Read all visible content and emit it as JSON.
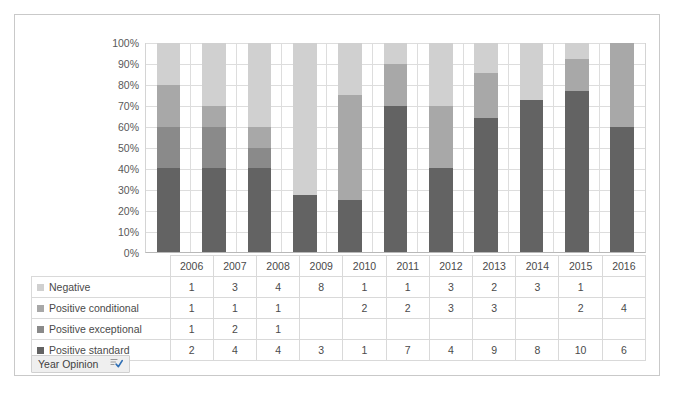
{
  "chart_data": {
    "type": "bar",
    "subtype": "stacked-100-percent-column",
    "title": "",
    "xlabel": "",
    "ylabel": "",
    "ylim": [
      0,
      100
    ],
    "ytick_labels": [
      "100%",
      "90%",
      "80%",
      "70%",
      "60%",
      "50%",
      "40%",
      "30%",
      "20%",
      "10%",
      "0%"
    ],
    "ytick_values": [
      100,
      90,
      80,
      70,
      60,
      50,
      40,
      30,
      20,
      10,
      0
    ],
    "grid": true,
    "legend_position": "table-left",
    "categories": [
      "2006",
      "2007",
      "2008",
      "2009",
      "2010",
      "2011",
      "2012",
      "2013",
      "2014",
      "2015",
      "2016"
    ],
    "series": [
      {
        "name": "Negative",
        "color": "#d0d0d0",
        "values": [
          1,
          3,
          4,
          8,
          1,
          1,
          3,
          2,
          3,
          1,
          null
        ],
        "display": [
          "1",
          "3",
          "4",
          "8",
          "1",
          "1",
          "3",
          "2",
          "3",
          "1",
          ""
        ]
      },
      {
        "name": "Positive conditional",
        "color": "#a8a8a8",
        "values": [
          1,
          1,
          1,
          null,
          2,
          2,
          3,
          3,
          null,
          2,
          4
        ],
        "display": [
          "1",
          "1",
          "1",
          "",
          "2",
          "2",
          "3",
          "3",
          "",
          "2",
          "4"
        ]
      },
      {
        "name": "Positive exceptional",
        "color": "#8a8a8a",
        "values": [
          1,
          2,
          1,
          null,
          null,
          null,
          null,
          null,
          null,
          null,
          null
        ],
        "display": [
          "1",
          "2",
          "1",
          "",
          "",
          "",
          "",
          "",
          "",
          "",
          ""
        ]
      },
      {
        "name": "Positive standard",
        "color": "#636363",
        "values": [
          2,
          4,
          4,
          3,
          1,
          7,
          4,
          9,
          8,
          10,
          6
        ],
        "display": [
          "2",
          "4",
          "4",
          "3",
          "1",
          "7",
          "4",
          "9",
          "8",
          "10",
          "6"
        ]
      }
    ],
    "column_totals": [
      5,
      10,
      10,
      11,
      4,
      10,
      10,
      14,
      11,
      13,
      10
    ]
  },
  "table": {
    "corner_label": "",
    "year_header": [
      "2006",
      "2007",
      "2008",
      "2009",
      "2010",
      "2011",
      "2012",
      "2013",
      "2014",
      "2015",
      "2016"
    ]
  },
  "field_button": {
    "label": "Year Opinion",
    "icon": "filter-sort-icon"
  },
  "colors": {
    "negative": "#d0d0d0",
    "positive_conditional": "#a8a8a8",
    "positive_exceptional": "#8a8a8a",
    "positive_standard": "#636363",
    "gridline": "#dddddd",
    "frame_border": "#c9c9c9",
    "text": "#4a4a4a"
  }
}
